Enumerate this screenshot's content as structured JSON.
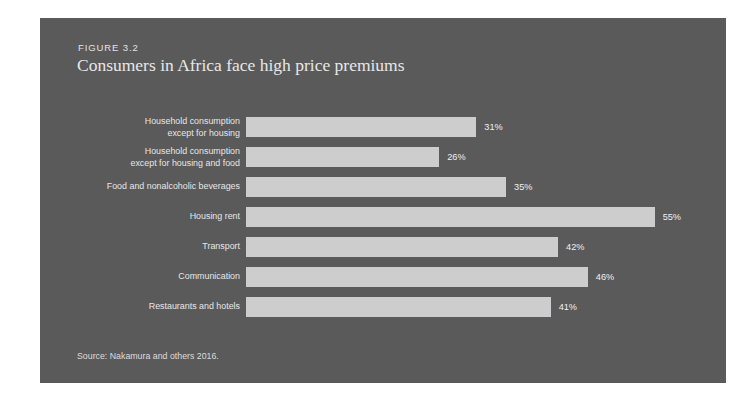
{
  "figure": {
    "number_label": "FIGURE 3.2",
    "title": "Consumers in Africa face high price premiums",
    "source": "Source: Nakamura and others 2016."
  },
  "colors": {
    "panel_background": "#5a5a5a",
    "bar_fill": "#cdcdcd",
    "label_text": "#e6e6e6",
    "title_text": "#e8e8e8",
    "page_background": "#ffffff"
  },
  "chart_data": {
    "type": "bar",
    "orientation": "horizontal",
    "title": "Consumers in Africa face high price premiums",
    "subtitle": "FIGURE 3.2",
    "xlabel": "",
    "ylabel": "",
    "grid": false,
    "legend": false,
    "xlim": [
      0,
      60
    ],
    "value_suffix": "%",
    "px_per_unit": 7.43,
    "categories": [
      "Household consumption\nexcept for housing",
      "Household consumption\nexcept for housing and food",
      "Food and nonalcoholic beverages",
      "Housing rent",
      "Transport",
      "Communication",
      "Restaurants and hotels"
    ],
    "values": [
      31,
      26,
      35,
      55,
      42,
      46,
      41
    ],
    "value_labels": [
      "31%",
      "26%",
      "35%",
      "55%",
      "42%",
      "46%",
      "41%"
    ]
  }
}
